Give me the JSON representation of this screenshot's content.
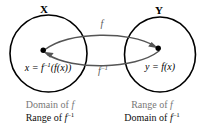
{
  "diagram": {
    "type": "function-inverse-mapping",
    "sets": {
      "left": {
        "label": "X",
        "element_label_parts": {
          "lhs": "x",
          "eq": " = ",
          "fn": "f",
          "exp": "–1",
          "arg": "(f(x))"
        },
        "element_label_plain": "x = f⁻¹(f(x))",
        "caption": {
          "line1_prefix": "Domain of ",
          "line1_var": "f",
          "line2_prefix": "Range of ",
          "line2_var": "f",
          "line2_exp": "–1"
        }
      },
      "right": {
        "label": "Y",
        "element_label_parts": {
          "lhs": "y",
          "eq": " = ",
          "fn": "f",
          "arg": "(x)"
        },
        "element_label_plain": "y = f(x)",
        "caption": {
          "line1_prefix": "Range of ",
          "line1_var": "f",
          "line2_prefix": "Domain of ",
          "line2_var": "f",
          "line2_exp": "–1"
        }
      }
    },
    "arrows": {
      "forward": {
        "label_fn": "f",
        "label_exp": "",
        "label_plain": "f",
        "direction": "left-to-right"
      },
      "inverse": {
        "label_fn": "f",
        "label_exp": "–1",
        "label_plain": "f⁻¹",
        "direction": "right-to-left"
      }
    },
    "colors": {
      "circle_stroke": "#000000",
      "arrow_stroke": "#555555",
      "dot_fill": "#000000",
      "caption_primary": "#787878",
      "caption_secondary": "#111111",
      "map_label": "#5a5a5a",
      "background": "#ffffff"
    }
  }
}
